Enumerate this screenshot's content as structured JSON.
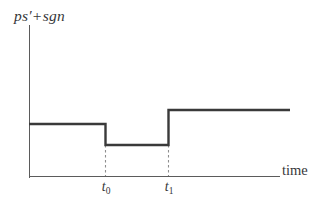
{
  "figure": {
    "y_axis_label_main": "ps",
    "y_axis_label_prime": "′",
    "y_axis_label_plus": "+",
    "y_axis_label_tail": "sgn",
    "x_axis_label": "time",
    "tick_t0_base": "t",
    "tick_t0_sub": "0",
    "tick_t1_base": "t",
    "tick_t1_sub": "1",
    "caption_partial": ""
  },
  "colors": {
    "curve": "#3a3a3a",
    "axis": "#5b5b5b",
    "dropline": "#8e8e8e",
    "text": "#37373a",
    "background": "#ffffff"
  },
  "chart_data": {
    "type": "line",
    "title": "",
    "subtitle": "",
    "xlabel": "time",
    "ylabel": "ps' + sgn",
    "grid": false,
    "legend": "none",
    "step_style": "hv",
    "xlim": [
      0,
      10
    ],
    "ylim": [
      0,
      5
    ],
    "xticks": [
      3,
      5.5
    ],
    "xticklabels": [
      "t_0",
      "t_1"
    ],
    "yticks": [],
    "yticklabels": [],
    "annotations": [
      {
        "text": "t_0",
        "type": "x-tick-dropline",
        "x": 3
      },
      {
        "text": "t_1",
        "type": "x-tick-dropline",
        "x": 5.5
      }
    ],
    "series": [
      {
        "name": "ps' + sgn",
        "type": "step",
        "x": [
          0,
          3,
          3,
          5.5,
          5.5,
          10.4
        ],
        "y": [
          2.05,
          2.05,
          1.45,
          1.45,
          2.55,
          2.55
        ],
        "segments": [
          {
            "label": "before t_0",
            "x_start": 0,
            "x_end": 3,
            "level": 2.05
          },
          {
            "label": "between t_0 and t_1",
            "x_start": 3,
            "x_end": 5.5,
            "level": 1.45
          },
          {
            "label": "after t_1",
            "x_start": 5.5,
            "x_end": 10.4,
            "level": 2.55
          }
        ]
      }
    ],
    "pixel_geometry": {
      "y_axis_x": 29,
      "y_axis_top": 25,
      "y_axis_bottom": 178,
      "x_axis_y": 176,
      "x_axis_left": 29,
      "x_axis_right": 280,
      "level_1_y": 124,
      "level_2_y": 145,
      "level_3_y": 110,
      "t0_x": 105,
      "t1_x": 168,
      "curve_right_x": 290
    }
  }
}
